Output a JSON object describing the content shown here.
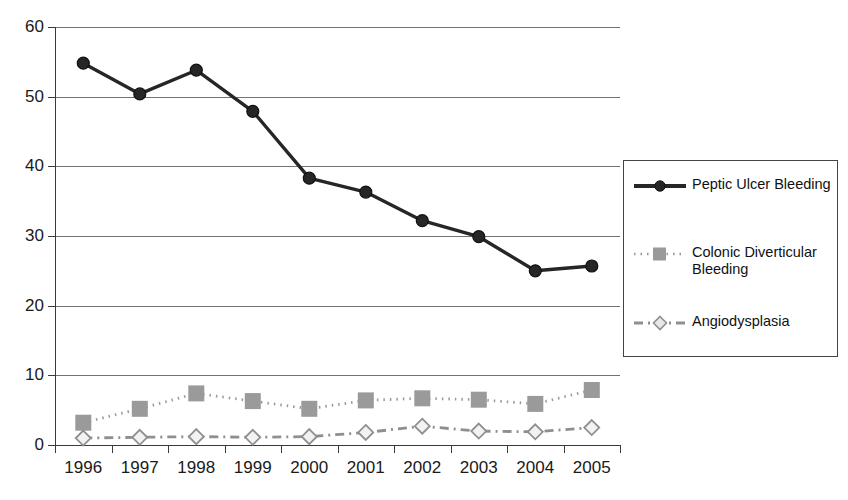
{
  "chart_data": {
    "type": "line",
    "title": "",
    "xlabel": "",
    "ylabel": "",
    "categories": [
      "1996",
      "1997",
      "1998",
      "1999",
      "2000",
      "2001",
      "2002",
      "2003",
      "2004",
      "2005"
    ],
    "ylim": [
      0,
      60
    ],
    "yticks": [
      0,
      10,
      20,
      30,
      40,
      50,
      60
    ],
    "grid": true,
    "legend_position": "right",
    "series": [
      {
        "name": "Peptic Ulcer Bleeding",
        "marker": "circle",
        "line_style": "solid",
        "color": "#262626",
        "values": [
          54.8,
          50.4,
          53.8,
          47.9,
          38.3,
          36.3,
          32.2,
          29.9,
          25.0,
          25.7
        ]
      },
      {
        "name": "Colonic Diverticular Bleeding",
        "marker": "square",
        "line_style": "dotted",
        "color": "#9a9a9a",
        "values": [
          3.2,
          5.2,
          7.4,
          6.3,
          5.2,
          6.4,
          6.7,
          6.5,
          5.9,
          7.9
        ]
      },
      {
        "name": "Angiodysplasia",
        "marker": "diamond",
        "line_style": "dashed",
        "color": "#8f8f8f",
        "values": [
          1.0,
          1.1,
          1.2,
          1.1,
          1.2,
          1.8,
          2.7,
          2.0,
          1.9,
          2.5
        ]
      }
    ]
  },
  "axes": {
    "y_tick_labels": [
      "60",
      "50",
      "40",
      "30",
      "20",
      "10",
      "0"
    ],
    "x_tick_labels": [
      "1996",
      "1997",
      "1998",
      "1999",
      "2000",
      "2001",
      "2002",
      "2003",
      "2004",
      "2005"
    ]
  },
  "legend": {
    "entries": [
      {
        "label": "Peptic Ulcer Bleeding",
        "key": "solid-circle-key"
      },
      {
        "label": "Colonic Diverticular Bleeding",
        "key": "dotted-square-key"
      },
      {
        "label": "Angiodysplasia",
        "key": "dashed-diamond-key"
      }
    ]
  }
}
